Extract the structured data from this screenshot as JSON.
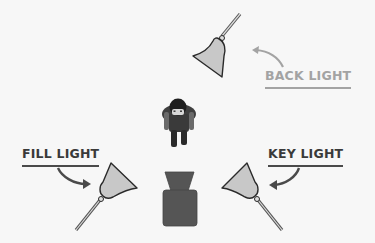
{
  "diagram": {
    "labels": {
      "back_light": "BACK LIGHT",
      "fill_light": "FILL LIGHT",
      "key_light": "KEY LIGHT"
    },
    "elements": [
      {
        "id": "back-light",
        "type": "lamp",
        "position": "top-center-right",
        "label": "BACK LIGHT"
      },
      {
        "id": "fill-light",
        "type": "lamp",
        "position": "bottom-left",
        "label": "FILL LIGHT"
      },
      {
        "id": "key-light",
        "type": "lamp",
        "position": "bottom-right",
        "label": "KEY LIGHT"
      },
      {
        "id": "subject",
        "type": "person",
        "position": "center"
      },
      {
        "id": "camera",
        "type": "camera",
        "position": "bottom-center"
      }
    ],
    "colors": {
      "background": "#f7f7f7",
      "lamp_fill": "#c8c8c8",
      "outline": "#2a2a2a",
      "camera": "#555555",
      "label_dark": "#3a3a3a",
      "label_light": "#a3a3a3"
    }
  }
}
